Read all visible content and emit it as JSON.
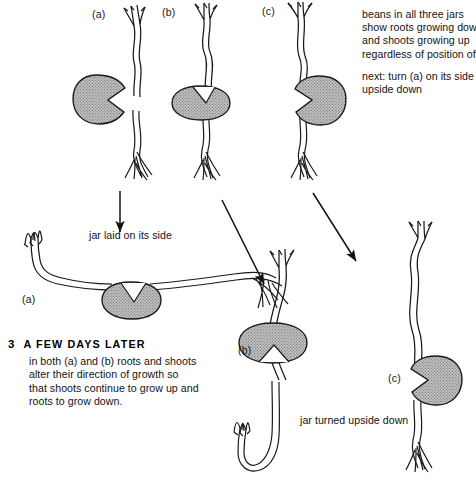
{
  "figure": {
    "title_step_number": "3",
    "title_step_text": "A FEW DAYS LATER",
    "step_body": "in both (a) and (b) roots and shoots alter their direction of growth so that shoots continue to grow up and roots to grow down.",
    "note_paragraph_1": "beans in all three jars\nshow roots growing down\nand shoots growing up\nregardless of position of bean.",
    "note_paragraph_2": "next: turn (a) on its side turn (b)\nupside down",
    "caption_side": "jar laid on its side",
    "caption_upside": "jar turned\nupside down",
    "labels": {
      "top_a": "(a)",
      "top_b": "(b)",
      "top_c": "(c)",
      "mid_a": "(a)",
      "bottom_b": "(b)",
      "bottom_c": "(c)"
    },
    "colors": {
      "ink": "#161616",
      "bean_fill": "#b3b3b3",
      "bean_outline": "#1a1a1a",
      "paper": "#ffffff",
      "arrow": "#111111"
    },
    "elements": {
      "bean_icon": "bean-seed-icon",
      "shoot_icon": "shoot-icon",
      "root_icon": "root-icon",
      "arrow_icon": "arrow-icon"
    }
  }
}
